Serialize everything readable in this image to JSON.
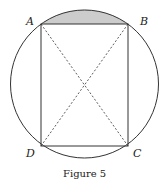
{
  "figure": {
    "caption": "Figure 5",
    "labels": {
      "A": "A",
      "B": "B",
      "C": "C",
      "D": "D"
    },
    "colors": {
      "stroke": "#333333",
      "shaded_segment": "#cccccc",
      "background": "#ffffff"
    },
    "shapes": [
      "circle",
      "rectangle ABCD inscribed in circle",
      "dashed diagonals AC and BD",
      "shaded circular segment above chord AB"
    ]
  }
}
